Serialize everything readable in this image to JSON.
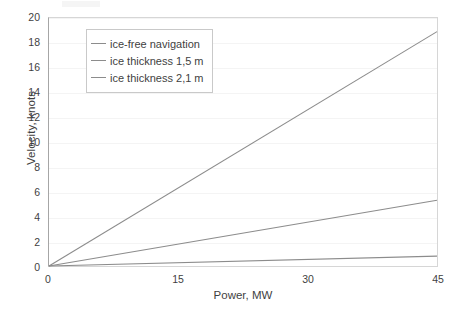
{
  "chart_data": {
    "type": "line",
    "title": "",
    "xlabel": "Power, MW",
    "ylabel": "Velocity, knots",
    "xlim": [
      0,
      45
    ],
    "ylim": [
      0,
      20
    ],
    "xticks": [
      "0",
      "15",
      "30",
      "45"
    ],
    "xtick_values": [
      0,
      15,
      30,
      45
    ],
    "yticks": [
      "0",
      "2",
      "4",
      "6",
      "8",
      "10",
      "12",
      "14",
      "16",
      "18",
      "20"
    ],
    "ytick_values": [
      0,
      2,
      4,
      6,
      8,
      10,
      12,
      14,
      16,
      18,
      20
    ],
    "grid": true,
    "grid_axis": "y",
    "legend_position": "upper-left-inside",
    "x": [
      0,
      45
    ],
    "series": [
      {
        "name": "ice-free navigation",
        "values": [
          0,
          18.9
        ],
        "color": "#8c8c8c"
      },
      {
        "name": "ice thickness 1,5 m",
        "values": [
          0,
          5.3
        ],
        "color": "#8c8c8c"
      },
      {
        "name": "ice thickness 2,1 m",
        "values": [
          0,
          0.8
        ],
        "color": "#8c8c8c"
      }
    ]
  },
  "axes": {
    "y_title": "Velocity, knots",
    "x_title": "Power, MW",
    "y_tick_labels": [
      "20",
      "18",
      "16",
      "14",
      "12",
      "10",
      "8",
      "6",
      "4",
      "2",
      "0"
    ],
    "x_tick_labels": [
      "0",
      "15",
      "30",
      "45"
    ]
  },
  "legend": {
    "items": [
      {
        "label": "ice-free navigation",
        "color": "#8c8c8c"
      },
      {
        "label": "ice thickness 1,5 m",
        "color": "#8c8c8c"
      },
      {
        "label": "ice thickness 2,1 m",
        "color": "#8c8c8c"
      }
    ]
  },
  "colors": {
    "line": "#8c8c8c",
    "text": "#3f3f3f",
    "grid": "#f4f4f4",
    "frame": "#d6d6d6",
    "axis": "#a6a6a6",
    "background": "#ffffff"
  }
}
